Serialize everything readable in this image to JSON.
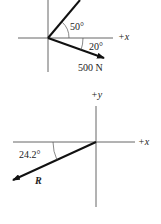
{
  "diagram_top": {
    "axis_x_label": "+x",
    "angle_upper_label": "50°",
    "angle_lower_label": "20°",
    "force_label": "500 N"
  },
  "diagram_bottom": {
    "axis_y_label": "+y",
    "axis_x_label": "+x",
    "angle_label": "24.2°",
    "resultant_label": "R"
  },
  "colors": {
    "line": "#222222",
    "axis": "#555555",
    "background": "#ffffff"
  }
}
